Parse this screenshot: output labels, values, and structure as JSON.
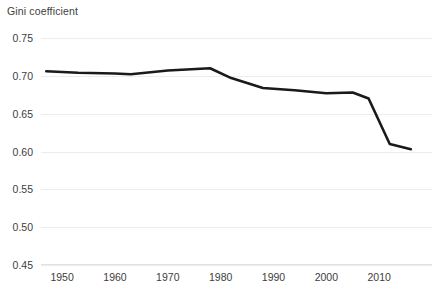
{
  "chart_data": {
    "type": "line",
    "title": "",
    "ylabel": "Gini coefficient",
    "xlabel": "",
    "ylim": [
      0.45,
      0.75
    ],
    "xlim": [
      1946,
      2020
    ],
    "yticks": [
      0.75,
      0.7,
      0.65,
      0.6,
      0.55,
      0.5,
      0.45
    ],
    "ytick_labels": [
      "0.75",
      "0.70",
      "0.65",
      "0.60",
      "0.55",
      "0.50",
      "0.45"
    ],
    "xticks": [
      1950,
      1960,
      1970,
      1980,
      1990,
      2000,
      2010
    ],
    "xtick_labels": [
      "1950",
      "1960",
      "1970",
      "1980",
      "1990",
      "2000",
      "2010"
    ],
    "grid": true,
    "legend": false,
    "line_color": "#1a1a1a",
    "line_width": 2.6,
    "background_color": "#ffffff",
    "gridline_color": "#ececed",
    "text_color": "#3d3d3d",
    "series": [
      {
        "name": "Gini coefficient",
        "x": [
          1947,
          1953,
          1960,
          1963,
          1970,
          1978,
          1982,
          1988,
          1994,
          2000,
          2005,
          2008,
          2012,
          2016
        ],
        "values": [
          0.706,
          0.704,
          0.703,
          0.702,
          0.707,
          0.71,
          0.697,
          0.684,
          0.681,
          0.677,
          0.678,
          0.67,
          0.61,
          0.603
        ]
      }
    ]
  }
}
